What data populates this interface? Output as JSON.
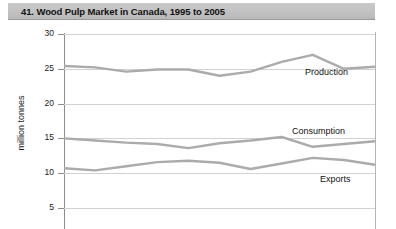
{
  "header": {
    "title": "41. Wood Pulp Market in Canada, 1995 to 2005"
  },
  "chart_data": {
    "type": "line",
    "title": "41. Wood Pulp Market in Canada, 1995 to 2005",
    "xlabel": "",
    "ylabel": "million tonnes",
    "ylim": [
      5,
      30
    ],
    "yticks": [
      30,
      25,
      20,
      15,
      10,
      5
    ],
    "ytick_labels": [
      "30",
      "25",
      "20",
      "15",
      "10",
      "5"
    ],
    "grid": true,
    "legend_position": "inline-right",
    "x": [
      1995,
      1996,
      1997,
      1998,
      1999,
      2000,
      2001,
      2002,
      2003,
      2004,
      2005
    ],
    "series": [
      {
        "name": "Production",
        "label": "Production",
        "color": "#ababab",
        "values": [
          25.4,
          25.2,
          24.6,
          24.9,
          24.9,
          24.0,
          24.6,
          26.0,
          27.0,
          25.0,
          25.3
        ]
      },
      {
        "name": "Consumption",
        "label": "Consumption",
        "color": "#ababab",
        "values": [
          15.0,
          14.7,
          14.4,
          14.2,
          13.6,
          14.3,
          14.7,
          15.2,
          13.8,
          14.2,
          14.6
        ]
      },
      {
        "name": "Exports",
        "label": "Exports",
        "color": "#ababab",
        "values": [
          10.7,
          10.4,
          11.0,
          11.6,
          11.8,
          11.5,
          10.6,
          11.4,
          12.2,
          11.9,
          11.2
        ]
      }
    ],
    "series_label_positions": [
      {
        "name": "Production",
        "left": 305,
        "top": 45
      },
      {
        "name": "Consumption",
        "left": 292,
        "top": 104
      },
      {
        "name": "Exports",
        "left": 320,
        "top": 152
      }
    ]
  }
}
